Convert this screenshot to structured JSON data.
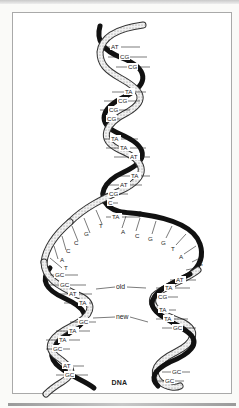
{
  "figure": {
    "caption": "DNA",
    "labels": {
      "old": "old",
      "new": "new"
    },
    "colors": {
      "dark_strand": "#111111",
      "light_strand": "#d8d8d8",
      "frame": "#a9a9a9",
      "background": "#ffffff"
    }
  },
  "parent_helix": {
    "base_pairs": [
      "AT",
      "CG",
      "CG",
      "TA",
      "CG",
      "CG",
      "CG",
      "TA",
      "TA",
      "AT",
      "TA",
      "AT",
      "CG",
      "C",
      "TA"
    ]
  },
  "left_unpaired_bases": [
    "T",
    "G",
    "C",
    "C",
    "A",
    "T"
  ],
  "right_unpaired_bases": [
    "A",
    "C",
    "G",
    "G",
    "T",
    "A",
    "G",
    "G"
  ],
  "left_daughter_helix": {
    "base_pairs": [
      "GC",
      "GC",
      "AT",
      "TA",
      "GC",
      "TA",
      "TA",
      "GC",
      "AT",
      "GC"
    ]
  },
  "right_daughter_helix": {
    "base_pairs": [
      "AT",
      "TA",
      "CG",
      "TA",
      "TA",
      "GC",
      "GC",
      "GC"
    ]
  }
}
